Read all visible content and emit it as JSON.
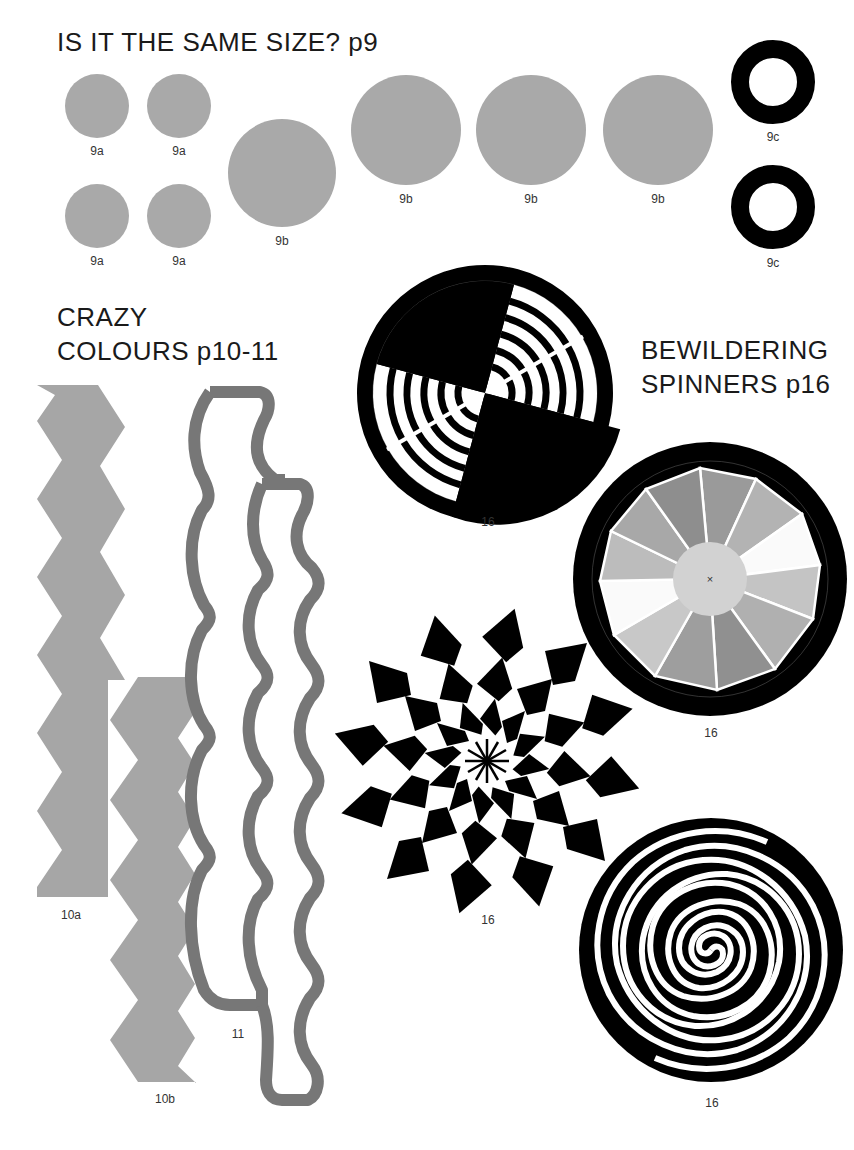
{
  "sections": {
    "same_size": {
      "title": "IS IT THE SAME SIZE? p9"
    },
    "crazy_colours": {
      "title_line1": "CRAZY",
      "title_line2": "COLOURS p10-11"
    },
    "spinners": {
      "title_line1": "BEWILDERING",
      "title_line2": "SPINNERS p16"
    }
  },
  "figures": {
    "c9a": [
      {
        "label": "9a",
        "cx": 97,
        "cy": 106,
        "r": 32
      },
      {
        "label": "9a",
        "cx": 179,
        "cy": 106,
        "r": 32
      },
      {
        "label": "9a",
        "cx": 97,
        "cy": 216,
        "r": 32
      },
      {
        "label": "9a",
        "cx": 179,
        "cy": 216,
        "r": 32
      }
    ],
    "c9b": [
      {
        "label": "9b",
        "cx": 282,
        "cy": 173,
        "r": 54
      },
      {
        "label": "9b",
        "cx": 406,
        "cy": 130,
        "r": 55
      },
      {
        "label": "9b",
        "cx": 531,
        "cy": 130,
        "r": 55
      },
      {
        "label": "9b",
        "cx": 658,
        "cy": 130,
        "r": 55
      }
    ],
    "c9c": [
      {
        "label": "9c",
        "cx": 773,
        "cy": 82
      },
      {
        "label": "9c",
        "cx": 773,
        "cy": 207
      }
    ],
    "labels": {
      "f10a": "10a",
      "f10b": "10b",
      "f11": "11",
      "spin1": "16",
      "spin2": "16",
      "spin3": "16",
      "spin4": "16"
    }
  },
  "colors": {
    "gray_circle": "#a9a9a9",
    "zigzag": "#a6a6a6",
    "wavy_outline": "#777777",
    "black": "#000000",
    "segments": [
      "#9a9a9a",
      "#b3b3b3",
      "#cfcfcf",
      "#ffffff",
      "#c4c4c4",
      "#b0b0b0",
      "#909090",
      "#9e9e9e",
      "#c8c8c8",
      "#fafafa",
      "#bcbcbc",
      "#a8a8a8"
    ],
    "center_disc": "#d2d2d2"
  }
}
